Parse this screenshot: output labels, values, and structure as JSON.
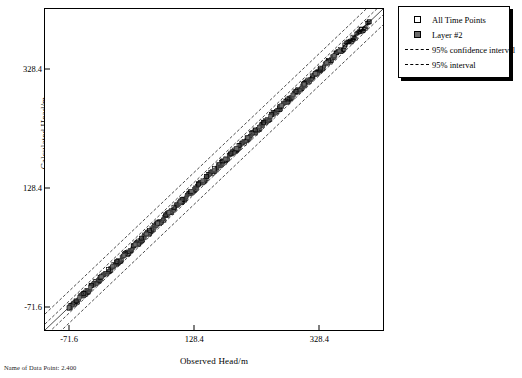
{
  "chart_data": {
    "type": "scatter",
    "title": "",
    "xlabel": "Observed Head/m",
    "ylabel": "Calculated Head/m",
    "xticks": [
      -71.6,
      128.4,
      328.4
    ],
    "yticks": [
      -71.6,
      128.4,
      328.4
    ],
    "xlim": [
      -110,
      430
    ],
    "ylim": [
      -110,
      430
    ],
    "grid": false,
    "legend_position": "top-right",
    "series": [
      {
        "name": "All Time Points",
        "marker": "open-square",
        "color": "#000000",
        "x": [
          -71.6,
          -60.2,
          -48.0,
          -35.5,
          -22.0,
          -8.5,
          5.0,
          18.0,
          31.0,
          44.0,
          57.0,
          70.0,
          83.0,
          96.0,
          109.0,
          122.0,
          135.0,
          148.0,
          161.0,
          174.0,
          187.0,
          200.0,
          213.0,
          226.0,
          239.0,
          252.0,
          265.0,
          278.0,
          291.0,
          304.0,
          317.0,
          330.0,
          343.0,
          356.0,
          369.0,
          382.0,
          395.0,
          408.0
        ],
        "y": [
          -73.0,
          -61.0,
          -48.5,
          -35.0,
          -21.5,
          -8.0,
          5.5,
          18.5,
          31.5,
          44.5,
          57.5,
          70.5,
          83.5,
          96.5,
          109.5,
          122.5,
          135.5,
          148.5,
          161.5,
          174.5,
          187.5,
          200.5,
          213.5,
          226.5,
          239.5,
          252.5,
          265.5,
          278.5,
          291.5,
          304.5,
          317.5,
          330.5,
          343.5,
          356.5,
          369.5,
          382.5,
          395.5,
          408.5
        ]
      },
      {
        "name": "Layer #2",
        "marker": "filled-square",
        "color": "#6b6b6b",
        "x": [
          -71.6,
          -55.0,
          -38.0,
          -20.0,
          -2.0,
          16.0,
          34.0,
          52.0,
          70.0,
          88.0,
          106.0,
          124.0,
          142.0,
          160.0,
          178.0,
          196.0,
          214.0,
          232.0,
          250.0,
          268.0,
          286.0,
          304.0,
          322.0,
          340.0,
          352.0,
          360.0
        ],
        "y": [
          -72.0,
          -55.5,
          -38.5,
          -20.5,
          -2.5,
          15.5,
          33.5,
          51.5,
          69.5,
          87.5,
          105.5,
          123.5,
          141.5,
          159.5,
          177.5,
          195.5,
          213.5,
          231.5,
          249.5,
          267.5,
          285.5,
          303.5,
          321.5,
          339.5,
          351.5,
          359.5
        ]
      }
    ],
    "reference_lines": [
      {
        "name": "95% confidence interval",
        "style": "dashed",
        "color": "#000000",
        "offset": 6
      },
      {
        "name": "95% interval",
        "style": "dashed",
        "color": "#000000",
        "offset": 16
      }
    ]
  },
  "legend": {
    "items": [
      {
        "label": "All Time Points",
        "key": "open-square"
      },
      {
        "label": "Layer #2",
        "key": "filled-square"
      },
      {
        "label": "95% confidence interval",
        "key": "dashed-line"
      },
      {
        "label": "95% interval",
        "key": "dashed-line"
      }
    ]
  },
  "axes": {
    "x_title": "Observed Head/m",
    "y_title": "Calculated Head/m",
    "x_tick_labels": [
      "-71.6",
      "128.4",
      "328.4"
    ],
    "y_tick_labels": [
      "-71.6",
      "128.4",
      "328.4"
    ]
  },
  "footer": {
    "note": "Name of Data Point: 2.400"
  }
}
